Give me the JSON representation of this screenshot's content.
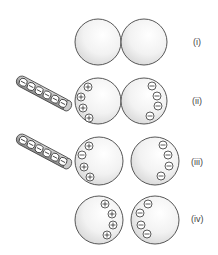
{
  "stages": [
    {
      "label": "(i)",
      "rod": false,
      "left_charges": "",
      "right_charges": "",
      "touching": true
    },
    {
      "label": "(ii)",
      "rod": true,
      "rod_charge": "−",
      "left_charges": "+",
      "right_charges": "−",
      "touching": true
    },
    {
      "label": "(iii)",
      "rod": true,
      "rod_charge": "−",
      "left_charges": "+",
      "right_charges": "−",
      "touching": false
    },
    {
      "label": "(iv)",
      "rod": false,
      "left_charges": "+",
      "right_charges": "−",
      "touching": false
    }
  ],
  "colors": {
    "sphere_fill": "#f2f2f2",
    "sphere_stroke": "#444444",
    "rod_fill": "#bdbdbd"
  }
}
